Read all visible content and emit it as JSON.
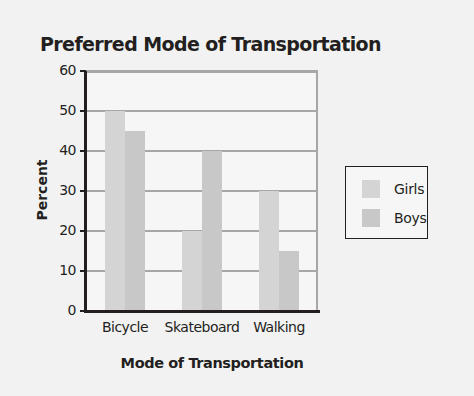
{
  "chart_data": {
    "type": "bar",
    "title": "Preferred Mode of Transportation",
    "xlabel": "Mode of Transportation",
    "ylabel": "Percent",
    "categories": [
      "Bicycle",
      "Skateboard",
      "Walking"
    ],
    "series": [
      {
        "name": "Girls",
        "values": [
          50,
          20,
          30
        ],
        "color": "#d4d4d4"
      },
      {
        "name": "Boys",
        "values": [
          45,
          40,
          15
        ],
        "color": "#c8c8c8"
      }
    ],
    "ylim": [
      0,
      60
    ],
    "yticks": [
      0,
      10,
      20,
      30,
      40,
      50,
      60
    ],
    "grid": true,
    "legend_position": "right"
  }
}
